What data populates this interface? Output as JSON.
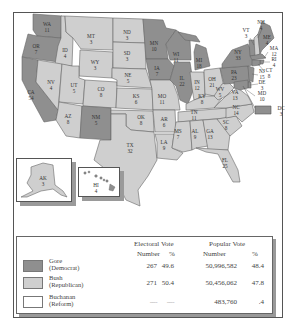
{
  "colors": {
    "gore": "#8f8f8f",
    "bush": "#cfcfcf",
    "nader": "#ffffff",
    "buchanan": "#ffffff",
    "border": "#555555",
    "state_line": "#666666"
  },
  "map": {
    "title": "",
    "states": [
      {
        "abbr": "WA",
        "ev": "11",
        "winner": "gore"
      },
      {
        "abbr": "OR",
        "ev": "7",
        "winner": "gore"
      },
      {
        "abbr": "CA",
        "ev": "54",
        "winner": "gore"
      },
      {
        "abbr": "ID",
        "ev": "4",
        "winner": "bush"
      },
      {
        "abbr": "NV",
        "ev": "4",
        "winner": "bush"
      },
      {
        "abbr": "MT",
        "ev": "3",
        "winner": "bush"
      },
      {
        "abbr": "WY",
        "ev": "3",
        "winner": "bush"
      },
      {
        "abbr": "UT",
        "ev": "5",
        "winner": "bush"
      },
      {
        "abbr": "AZ",
        "ev": "8",
        "winner": "bush"
      },
      {
        "abbr": "CO",
        "ev": "8",
        "winner": "bush"
      },
      {
        "abbr": "NM",
        "ev": "5",
        "winner": "gore"
      },
      {
        "abbr": "ND",
        "ev": "3",
        "winner": "bush"
      },
      {
        "abbr": "SD",
        "ev": "3",
        "winner": "bush"
      },
      {
        "abbr": "NE",
        "ev": "5",
        "winner": "bush"
      },
      {
        "abbr": "KS",
        "ev": "6",
        "winner": "bush"
      },
      {
        "abbr": "OK",
        "ev": "8",
        "winner": "bush"
      },
      {
        "abbr": "TX",
        "ev": "32",
        "winner": "bush"
      },
      {
        "abbr": "MN",
        "ev": "10",
        "winner": "gore"
      },
      {
        "abbr": "IA",
        "ev": "7",
        "winner": "gore"
      },
      {
        "abbr": "MO",
        "ev": "11",
        "winner": "bush"
      },
      {
        "abbr": "AR",
        "ev": "6",
        "winner": "bush"
      },
      {
        "abbr": "LA",
        "ev": "9",
        "winner": "bush"
      },
      {
        "abbr": "WI",
        "ev": "11",
        "winner": "gore"
      },
      {
        "abbr": "IL",
        "ev": "22",
        "winner": "gore"
      },
      {
        "abbr": "MI",
        "ev": "18",
        "winner": "gore"
      },
      {
        "abbr": "IN",
        "ev": "12",
        "winner": "bush"
      },
      {
        "abbr": "OH",
        "ev": "21",
        "winner": "bush"
      },
      {
        "abbr": "KY",
        "ev": "8",
        "winner": "bush"
      },
      {
        "abbr": "TN",
        "ev": "11",
        "winner": "bush"
      },
      {
        "abbr": "MS",
        "ev": "7",
        "winner": "bush"
      },
      {
        "abbr": "AL",
        "ev": "9",
        "winner": "bush"
      },
      {
        "abbr": "GA",
        "ev": "13",
        "winner": "bush"
      },
      {
        "abbr": "FL",
        "ev": "25",
        "winner": "bush"
      },
      {
        "abbr": "SC",
        "ev": "8",
        "winner": "bush"
      },
      {
        "abbr": "NC",
        "ev": "14",
        "winner": "bush"
      },
      {
        "abbr": "VA",
        "ev": "13",
        "winner": "bush"
      },
      {
        "abbr": "WV",
        "ev": "5",
        "winner": "bush"
      },
      {
        "abbr": "PA",
        "ev": "23",
        "winner": "gore"
      },
      {
        "abbr": "NY",
        "ev": "33",
        "winner": "gore"
      },
      {
        "abbr": "VT",
        "ev": "3",
        "winner": "gore"
      },
      {
        "abbr": "NH",
        "ev": "4",
        "winner": "bush"
      },
      {
        "abbr": "ME",
        "ev": "4",
        "winner": "gore"
      },
      {
        "abbr": "MA",
        "ev": "12",
        "winner": "gore"
      },
      {
        "abbr": "RI",
        "ev": "4",
        "winner": "gore"
      },
      {
        "abbr": "CT",
        "ev": "8",
        "winner": "gore"
      },
      {
        "abbr": "NJ",
        "ev": "15",
        "winner": "gore"
      },
      {
        "abbr": "DE",
        "ev": "3",
        "winner": "gore"
      },
      {
        "abbr": "MD",
        "ev": "10",
        "winner": "gore"
      },
      {
        "abbr": "DC",
        "ev": "3",
        "winner": "gore"
      },
      {
        "abbr": "AK",
        "ev": "3",
        "winner": "bush"
      },
      {
        "abbr": "HI",
        "ev": "4",
        "winner": "gore"
      }
    ]
  },
  "legend": {
    "headers": {
      "electoral_vote": "Electoral Vote",
      "popular_vote": "Popular Vote",
      "ev_number": "Number",
      "ev_percent": "%",
      "pv_number": "Number",
      "pv_percent": "%"
    },
    "rows": [
      {
        "name": "Gore",
        "party": "(Democrat)",
        "ev_number": "267",
        "ev_percent": "49.6",
        "pv_number": "50,996,582",
        "pv_percent": "48.4",
        "swatch": "gore"
      },
      {
        "name": "Bush",
        "party": "(Republican)",
        "ev_number": "271",
        "ev_percent": "50.4",
        "pv_number": "50,456,062",
        "pv_percent": "47.8",
        "swatch": "bush"
      },
      {
        "name": "Nader",
        "party": "(Green)",
        "ev_number": "----",
        "ev_percent": "----",
        "pv_number": "2,858,843",
        "pv_percent": "2.7",
        "swatch": "nader"
      },
      {
        "name": "Buchanan",
        "party": "(Reform)",
        "ev_number": "----",
        "ev_percent": "----",
        "pv_number": "483,760",
        "pv_percent": ".4",
        "swatch": "buchanan"
      }
    ]
  }
}
